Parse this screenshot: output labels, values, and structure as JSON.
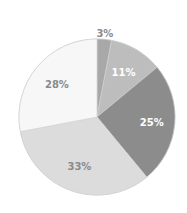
{
  "chart_data": {
    "type": "pie",
    "title": "",
    "categories": [
      "A",
      "B",
      "C",
      "D",
      "E"
    ],
    "values": [
      3,
      11,
      25,
      33,
      28
    ],
    "labels": [
      "3%",
      "11%",
      "25%",
      "33%",
      "28%"
    ],
    "colors": [
      "#a8a8a8",
      "#bdbdbd",
      "#8c8c8c",
      "#dcdcdc",
      "#f7f7f7"
    ],
    "label_colors": [
      "#8a8a8a",
      "#ffffff",
      "#ffffff",
      "#8a8a8a",
      "#8a8a8a"
    ],
    "start_angle_deg": -90,
    "direction": "clockwise",
    "legend": "none"
  }
}
